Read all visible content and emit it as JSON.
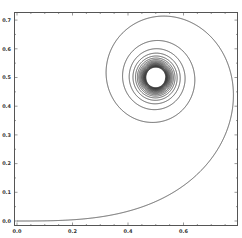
{
  "chart_data": {
    "type": "line",
    "title": "",
    "xlabel": "",
    "ylabel": "",
    "parametric": {
      "x": "integral_0^t cos(pi*u^2/2) du",
      "y": "integral_0^t sin(pi*u^2/2) du",
      "t_min": 0,
      "t_max": 9
    },
    "xlim": [
      0.0,
      0.79
    ],
    "ylim": [
      -0.01,
      0.72
    ],
    "x_ticks": [
      "0.0",
      "0.2",
      "0.4",
      "0.6"
    ],
    "y_ticks": [
      "0.0",
      "0.1",
      "0.2",
      "0.3",
      "0.4",
      "0.5",
      "0.6",
      "0.7"
    ],
    "series": [
      {
        "name": "spiral",
        "color": "#333333",
        "sample_points": [
          [
            0.0,
            0.0
          ],
          [
            0.2,
            0.004
          ],
          [
            0.4,
            0.033
          ],
          [
            0.6,
            0.111
          ],
          [
            0.72,
            0.24
          ],
          [
            0.78,
            0.44
          ],
          [
            0.76,
            0.55
          ],
          [
            0.66,
            0.69
          ],
          [
            0.53,
            0.71
          ],
          [
            0.4,
            0.59
          ],
          [
            0.45,
            0.35
          ],
          [
            0.55,
            0.36
          ],
          [
            0.61,
            0.5
          ],
          [
            0.54,
            0.64
          ],
          [
            0.44,
            0.5
          ],
          [
            0.5,
            0.5
          ]
        ]
      }
    ],
    "grid": false,
    "legend": null,
    "frame": true
  }
}
